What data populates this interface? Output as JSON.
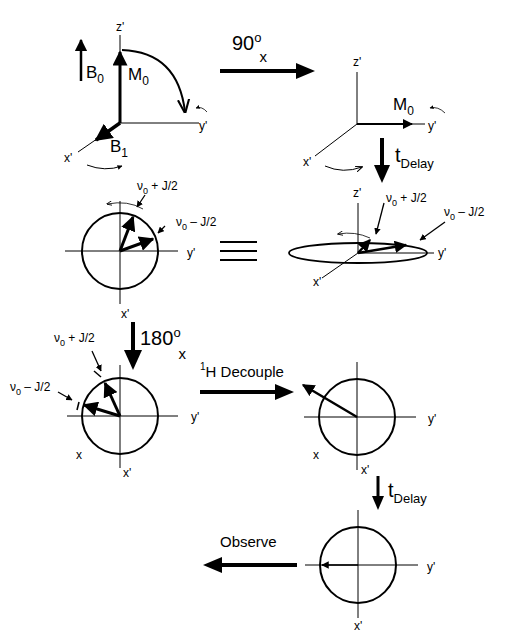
{
  "labels": {
    "z_prime": "z'",
    "y_prime": "y'",
    "x_prime": "x'",
    "x": "x",
    "B0": "B",
    "B0_sub": "0",
    "B1": "B",
    "B1_sub": "1",
    "M0": "M",
    "M0_sub": "0",
    "pulse90": "90",
    "pulse90_sup": "o",
    "pulse90_sub": "x",
    "t": "t",
    "delay_sub": "Delay",
    "nu_plus": "ν",
    "nu_plus_sub": "0",
    "nu_plus_rest": " + J/2",
    "nu_minus": "ν",
    "nu_minus_sub": "0",
    "nu_minus_rest": " – J/2",
    "pulse180": "180",
    "pulse180_sup": "o",
    "pulse180_sub": "x",
    "decouple_sup": "1",
    "decouple": "H Decouple",
    "observe": "Observe"
  }
}
